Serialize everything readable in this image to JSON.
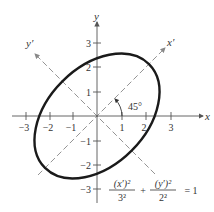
{
  "diagram": {
    "axes": {
      "x_label": "x",
      "y_label": "y",
      "x_prime_label": "x′",
      "y_prime_label": "y′",
      "x_ticks": [
        "−3",
        "−2",
        "−1",
        "1",
        "2",
        "3"
      ],
      "y_ticks": [
        "3",
        "2",
        "1",
        "−1",
        "−2",
        "−3"
      ]
    },
    "angle_label": "45°",
    "equation": {
      "term1_num": "(x′)²",
      "term1_den": "3²",
      "plus": "+",
      "term2_num": "(y′)²",
      "term2_den": "2²",
      "equals": "= 1"
    },
    "ellipse": {
      "semi_major": 3,
      "semi_minor": 2,
      "rotation_deg": 45
    },
    "colors": {
      "curve": "#1a1a1a",
      "axis": "#555555",
      "dashed": "#888888"
    }
  }
}
